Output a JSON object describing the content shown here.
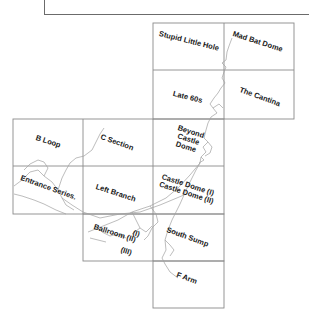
{
  "map": {
    "title": "Cave survey index map",
    "grid": {
      "columns_x": [
        13,
        83,
        153,
        224,
        294
      ],
      "rows_y": [
        23,
        70,
        119,
        166,
        214,
        261,
        308
      ],
      "line_color": "#8a8a8a",
      "passage_color": "#9a9a9a"
    },
    "cells": [
      {
        "id": "stupid-little-hole",
        "label": "Stupid Little Hole",
        "x": 160,
        "y": 32,
        "rot": 14
      },
      {
        "id": "mad-bat-dome",
        "label": "Mad Bat Dome",
        "x": 236,
        "y": 30,
        "rot": 18
      },
      {
        "id": "late-60s",
        "label": "Late 60s",
        "x": 174,
        "y": 90,
        "rot": 14
      },
      {
        "id": "the-cantina",
        "label": "The Cantina",
        "x": 241,
        "y": 88,
        "rot": 20
      },
      {
        "id": "b-loop",
        "label": "B Loop",
        "x": 37,
        "y": 137,
        "rot": 18
      },
      {
        "id": "c-section",
        "label": "C Section",
        "x": 102,
        "y": 135,
        "rot": 20
      },
      {
        "id": "beyond-castle-dome",
        "label": "Beyond\nCastle\nDome",
        "x": 176,
        "y": 123,
        "rot": 18
      },
      {
        "id": "entrance-series",
        "label": "Entrance Series.",
        "x": 22,
        "y": 178,
        "rot": 20
      },
      {
        "id": "left-branch",
        "label": "Left Branch",
        "x": 97,
        "y": 185,
        "rot": 18
      },
      {
        "id": "castle-dome",
        "label": "Castle Dome (I)\nCastle Dome (II)",
        "x": 163,
        "y": 172,
        "rot": 18
      },
      {
        "id": "ballroom",
        "label": "Ballroom (II)",
        "x": 95,
        "y": 226,
        "rot": 18
      },
      {
        "id": "ballroom-i",
        "label": "(I)",
        "x": 134,
        "y": 228,
        "rot": 18
      },
      {
        "id": "ballroom-iii",
        "label": "(III)",
        "x": 123,
        "y": 246,
        "rot": 18
      },
      {
        "id": "south-sump",
        "label": "South Sump",
        "x": 168,
        "y": 229,
        "rot": 20
      },
      {
        "id": "f-arm",
        "label": "F Arm",
        "x": 178,
        "y": 272,
        "rot": 20
      }
    ]
  }
}
